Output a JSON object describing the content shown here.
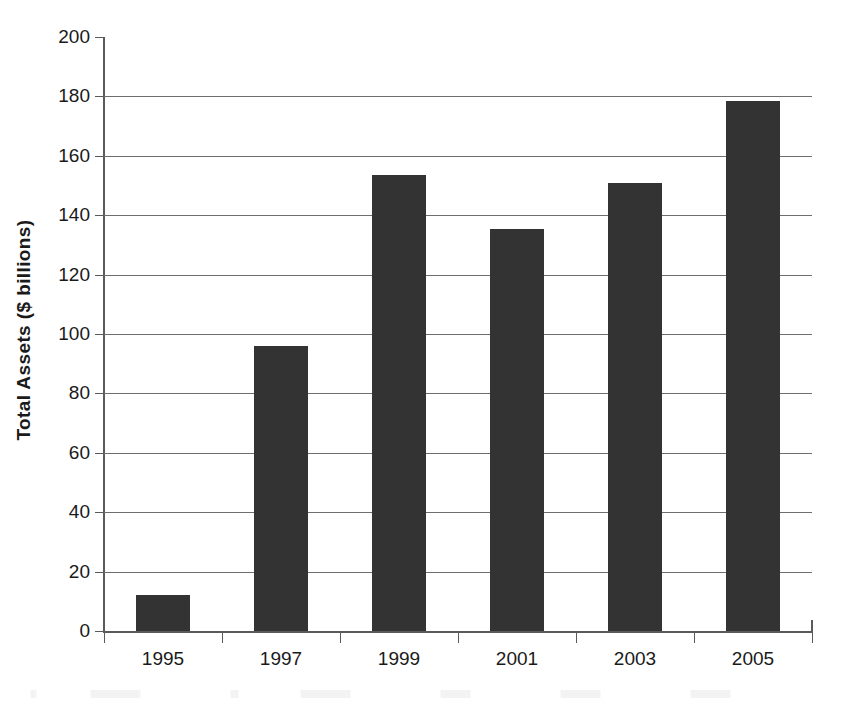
{
  "chart_data": {
    "type": "bar",
    "title": "",
    "subtitle": "",
    "xlabel": "",
    "ylabel": "Total Assets ($ billions)",
    "categories": [
      "1995",
      "1997",
      "1999",
      "2001",
      "2003",
      "2005"
    ],
    "values": [
      12,
      96,
      153.5,
      135.5,
      151,
      178.5
    ],
    "series": [
      {
        "name": "Total Assets",
        "values": [
          12,
          96,
          153.5,
          135.5,
          151,
          178.5
        ]
      }
    ],
    "ylim": [
      0,
      200
    ],
    "ytick_step": 20,
    "yticks": [
      0,
      20,
      40,
      60,
      80,
      100,
      120,
      140,
      160,
      180,
      200
    ],
    "ytick_labels": [
      "0",
      "20",
      "40",
      "60",
      "80",
      "100",
      "120",
      "140",
      "160",
      "180",
      "200"
    ],
    "grid": true,
    "grid_axis": "y",
    "legend": false,
    "legend_position": "none",
    "bar_color": "#333333",
    "grid_color": "#6e6e6e",
    "axis_color": "#5a5a5a",
    "text_color": "#1a1a1a",
    "background": "#ffffff",
    "annotations": []
  },
  "figure": {
    "name": "total-assets-bar-chart"
  }
}
